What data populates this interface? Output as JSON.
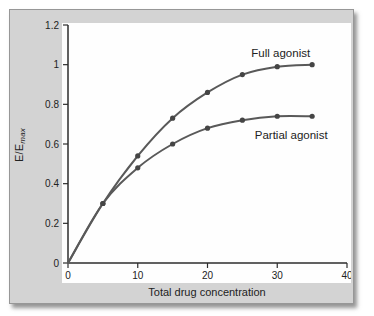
{
  "figure": {
    "panel_bg": "#d3d3d3",
    "plot_bg": "#fefefe",
    "axis_color": "#2d2d2d",
    "curve_color": "#595959",
    "marker_color": "#454545",
    "text_color": "#222222"
  },
  "chart_data": {
    "type": "line",
    "title": "",
    "xlabel": "Total drug concentration",
    "ylabel": "E/E",
    "ylabel_sub": "max",
    "xlim": [
      0,
      40
    ],
    "ylim": [
      0,
      1.2
    ],
    "x_ticks": [
      0,
      10,
      20,
      30,
      40
    ],
    "x_tick_labels": [
      "0",
      "10",
      "20",
      "30",
      "40"
    ],
    "y_ticks": [
      0,
      0.2,
      0.4,
      0.6,
      0.8,
      1,
      1.2
    ],
    "y_tick_labels": [
      "0",
      "0.2",
      "0.4",
      "0.6",
      "0.8",
      "1",
      "1.2"
    ],
    "x": [
      0,
      5,
      10,
      15,
      20,
      25,
      30,
      35
    ],
    "series": [
      {
        "name": "Full agonist",
        "values": [
          0,
          0.3,
          0.54,
          0.73,
          0.86,
          0.95,
          0.99,
          1.0
        ],
        "label_pos": {
          "x": 30.5,
          "y": 1.06
        }
      },
      {
        "name": "Partial agonist",
        "values": [
          0,
          0.3,
          0.48,
          0.6,
          0.68,
          0.72,
          0.74,
          0.74
        ],
        "label_pos": {
          "x": 32.0,
          "y": 0.645
        }
      }
    ],
    "grid": false,
    "legend": "inline-labels"
  }
}
